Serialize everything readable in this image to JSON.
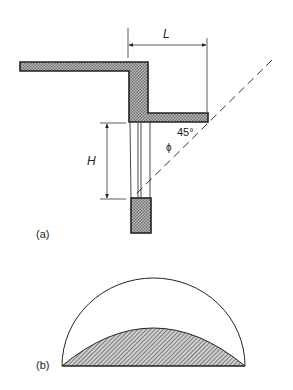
{
  "figure": {
    "part_a": {
      "label": "(a)",
      "dimensions": {
        "L": "L",
        "H": "H"
      },
      "angle_label": "45°",
      "angle_symbol": "ϕ"
    },
    "part_b": {
      "label": "(b)"
    },
    "colors": {
      "line": "#222222",
      "fill_pattern": "#8a8a8a",
      "background": "#ffffff"
    }
  }
}
